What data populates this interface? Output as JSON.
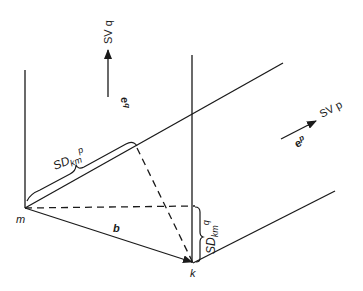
{
  "diagram": {
    "points": {
      "m": {
        "label": "m",
        "x": 25,
        "y": 208
      },
      "k": {
        "label": "k",
        "x": 193,
        "y": 263
      }
    },
    "vectors": {
      "b": {
        "label": "b",
        "from": "m",
        "to": "k"
      },
      "e_q": {
        "label": "e",
        "superscript": "q",
        "direction_label": "SV q"
      },
      "e_p": {
        "label": "e",
        "superscript": "p",
        "direction_label": "SV p"
      }
    },
    "braces": {
      "sd_kmp": {
        "base": "SD",
        "subscript": "km",
        "superscript": "p"
      },
      "sd_kmq": {
        "base": "SD",
        "subscript": "km",
        "superscript": "q"
      }
    },
    "colors": {
      "line": "#1a1a1a",
      "background": "#ffffff"
    }
  }
}
